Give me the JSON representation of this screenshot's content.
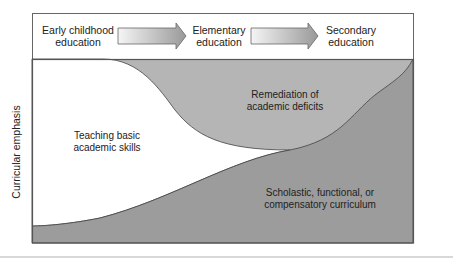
{
  "diagram": {
    "stages": [
      {
        "line1": "Early childhood",
        "line2": "education"
      },
      {
        "line1": "Elementary",
        "line2": "education"
      },
      {
        "line1": "Secondary",
        "line2": "education"
      }
    ],
    "y_axis_label": "Curricular emphasis",
    "regions": [
      {
        "id": "basic",
        "line1": "Teaching basic",
        "line2": "academic skills",
        "color": "#ffffff"
      },
      {
        "id": "remediation",
        "line1": "Remediation of",
        "line2": "academic deficits",
        "color": "#b5b5b5"
      },
      {
        "id": "scholastic",
        "line1": "Scholastic, functional, or",
        "line2": "compensatory curriculum",
        "color": "#9c9c9c"
      }
    ],
    "colors": {
      "border": "#555555",
      "arrow_light": "#f4f4f4",
      "arrow_dark": "#9a9a9a"
    }
  }
}
